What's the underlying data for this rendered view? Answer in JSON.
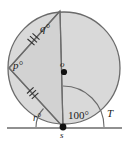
{
  "figure": {
    "type": "circle-geometry-diagram",
    "colors": {
      "circle_fill": "#d9d9d9",
      "polygon_fill": "#cfcfcf",
      "stroke": "#595959",
      "point": "#111111",
      "background": "#ffffff",
      "text": "#1a1a1a"
    },
    "labels": {
      "angle_q": "q°",
      "angle_p": "p°",
      "angle_r": "r°",
      "angle_100": "100°",
      "centre": "o",
      "tangent_point": "s",
      "tangent_end": "T"
    },
    "points": {
      "centre": {
        "x": 64,
        "y": 68,
        "name": "o"
      },
      "tangent_point": {
        "x": 63,
        "y": 127,
        "name": "s"
      },
      "top_vertex": {
        "x": 60,
        "y": 11,
        "name": "top"
      },
      "left_vertex": {
        "x": 9,
        "y": 68,
        "name": "left"
      },
      "tangent_line": {
        "x1": 8,
        "y1": 128,
        "x2": 122,
        "y2": 128
      },
      "circle": {
        "cx": 64,
        "cy": 68,
        "r": 56
      }
    },
    "marks": {
      "chord_upper_ticks": 3,
      "chord_lower_ticks": 3,
      "tick_meaning": "congruent chords"
    },
    "angles": [
      {
        "label": "q°",
        "at": "top vertex",
        "value": null
      },
      {
        "label": "p°",
        "at": "left vertex",
        "value": null
      },
      {
        "label": "r°",
        "at": "s between tangent and chord",
        "value": null
      },
      {
        "label": "100°",
        "at": "s between diameter and tangent toward T",
        "value": 100
      }
    ]
  }
}
